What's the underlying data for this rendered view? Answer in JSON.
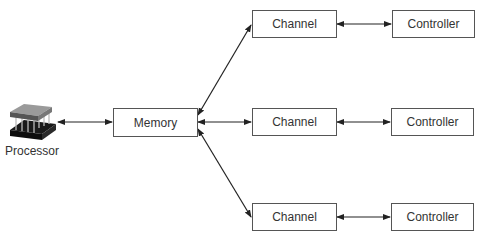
{
  "diagram": {
    "processor": {
      "label": "Processor",
      "icon": "processor-chip-icon"
    },
    "memory": {
      "label": "Memory"
    },
    "rows": [
      {
        "channel": "Channel",
        "controller": "Controller"
      },
      {
        "channel": "Channel",
        "controller": "Controller"
      },
      {
        "channel": "Channel",
        "controller": "Controller"
      }
    ],
    "connections": [
      {
        "from": "Processor",
        "to": "Memory",
        "type": "bidirectional"
      },
      {
        "from": "Memory",
        "to": "Channel (top)",
        "type": "bidirectional"
      },
      {
        "from": "Memory",
        "to": "Channel (middle)",
        "type": "bidirectional"
      },
      {
        "from": "Memory",
        "to": "Channel (bottom)",
        "type": "bidirectional"
      },
      {
        "from": "Channel (top)",
        "to": "Controller (top)",
        "type": "bidirectional"
      },
      {
        "from": "Channel (middle)",
        "to": "Controller (middle)",
        "type": "bidirectional"
      },
      {
        "from": "Channel (bottom)",
        "to": "Controller (bottom)",
        "type": "bidirectional"
      }
    ],
    "colors": {
      "line": "#222222",
      "box_border": "#555555",
      "text": "#333333"
    }
  }
}
